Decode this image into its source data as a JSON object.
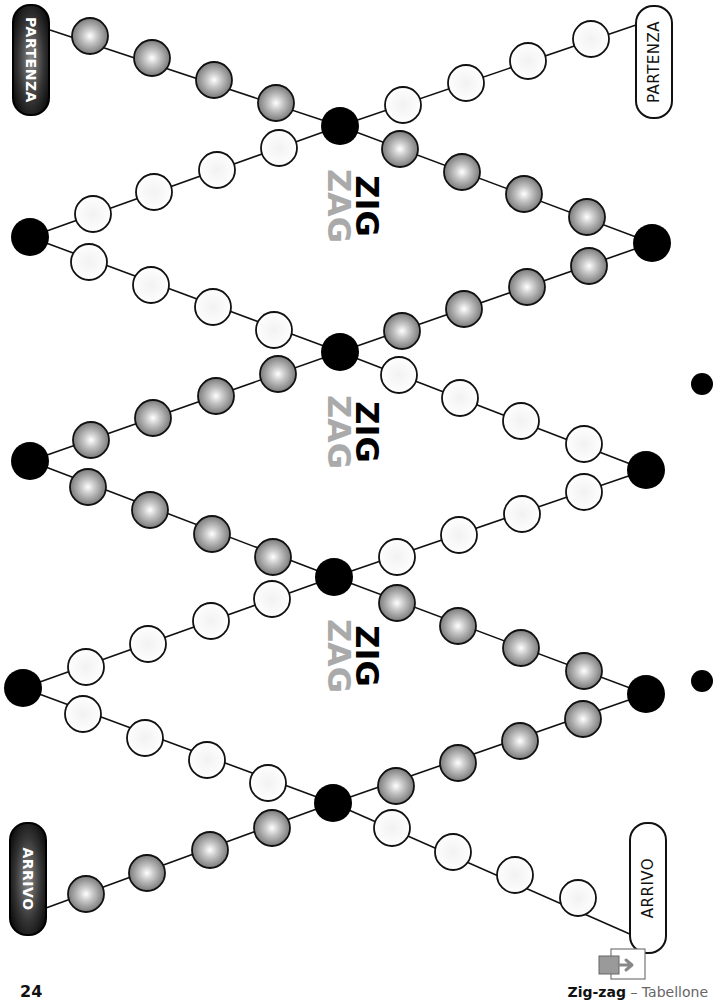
{
  "board": {
    "colors": {
      "gray_bead": "#9a9a9a",
      "white_bead": "#ffffff",
      "junction": "#000000",
      "line": "#111111",
      "zig": "#000000",
      "zag": "#aaaaaa"
    },
    "labels": {
      "start_left": "PARTENZA",
      "start_right": "PARTENZA",
      "finish_left": "ARRIVO",
      "finish_right": "ARRIVO"
    },
    "title_blocks": [
      {
        "zig": "ZIG",
        "zag": "ZAG"
      },
      {
        "zig": "ZIG",
        "zag": "ZAG"
      },
      {
        "zig": "ZIG",
        "zag": "ZAG"
      }
    ],
    "junctions": [
      {
        "id": "J1",
        "x": 340,
        "y": 126
      },
      {
        "id": "L1",
        "x": 30,
        "y": 237
      },
      {
        "id": "R1",
        "x": 652,
        "y": 243
      },
      {
        "id": "J2",
        "x": 340,
        "y": 352
      },
      {
        "id": "L2",
        "x": 30,
        "y": 461
      },
      {
        "id": "R2",
        "x": 646,
        "y": 470
      },
      {
        "id": "J3",
        "x": 334,
        "y": 577
      },
      {
        "id": "L3",
        "x": 23,
        "y": 688
      },
      {
        "id": "R3",
        "x": 646,
        "y": 694
      },
      {
        "id": "J4",
        "x": 333,
        "y": 803
      }
    ],
    "side_dots": [
      {
        "x": 702,
        "y": 384
      },
      {
        "x": 702,
        "y": 681
      }
    ],
    "segments": [
      {
        "from": [
          50,
          30
        ],
        "to": [
          340,
          126
        ],
        "type": "gray",
        "beads": [
          [
            90,
            36
          ],
          [
            152,
            58
          ],
          [
            214,
            80
          ],
          [
            276,
            103
          ]
        ]
      },
      {
        "from": [
          636,
          25
        ],
        "to": [
          340,
          126
        ],
        "type": "white",
        "beads": [
          [
            591,
            39
          ],
          [
            528,
            61
          ],
          [
            466,
            83
          ],
          [
            403,
            105
          ]
        ]
      },
      {
        "from": [
          340,
          126
        ],
        "to": [
          30,
          237
        ],
        "type": "white",
        "beads": [
          [
            279,
            148
          ],
          [
            217,
            170
          ],
          [
            154,
            192
          ],
          [
            93,
            214
          ]
        ]
      },
      {
        "from": [
          340,
          126
        ],
        "to": [
          652,
          243
        ],
        "type": "gray",
        "beads": [
          [
            400,
            149
          ],
          [
            462,
            172
          ],
          [
            524,
            194
          ],
          [
            587,
            217
          ]
        ]
      },
      {
        "from": [
          30,
          237
        ],
        "to": [
          340,
          352
        ],
        "type": "white",
        "beads": [
          [
            89,
            262
          ],
          [
            151,
            285
          ],
          [
            213,
            307
          ],
          [
            274,
            330
          ]
        ]
      },
      {
        "from": [
          652,
          243
        ],
        "to": [
          340,
          352
        ],
        "type": "gray",
        "beads": [
          [
            589,
            266
          ],
          [
            527,
            287
          ],
          [
            464,
            309
          ],
          [
            402,
            331
          ]
        ]
      },
      {
        "from": [
          340,
          352
        ],
        "to": [
          30,
          461
        ],
        "type": "gray",
        "beads": [
          [
            278,
            374
          ],
          [
            216,
            396
          ],
          [
            153,
            418
          ],
          [
            91,
            440
          ]
        ]
      },
      {
        "from": [
          340,
          352
        ],
        "to": [
          646,
          470
        ],
        "type": "white",
        "beads": [
          [
            399,
            375
          ],
          [
            460,
            398
          ],
          [
            521,
            421
          ],
          [
            584,
            444
          ]
        ]
      },
      {
        "from": [
          30,
          461
        ],
        "to": [
          334,
          577
        ],
        "type": "gray",
        "beads": [
          [
            88,
            487
          ],
          [
            150,
            510
          ],
          [
            212,
            534
          ],
          [
            273,
            557
          ]
        ]
      },
      {
        "from": [
          646,
          470
        ],
        "to": [
          334,
          577
        ],
        "type": "white",
        "beads": [
          [
            584,
            492
          ],
          [
            522,
            514
          ],
          [
            459,
            535
          ],
          [
            397,
            557
          ]
        ]
      },
      {
        "from": [
          334,
          577
        ],
        "to": [
          23,
          688
        ],
        "type": "white",
        "beads": [
          [
            272,
            599
          ],
          [
            211,
            621
          ],
          [
            148,
            644
          ],
          [
            86,
            667
          ]
        ]
      },
      {
        "from": [
          334,
          577
        ],
        "to": [
          646,
          694
        ],
        "type": "gray",
        "beads": [
          [
            397,
            603
          ],
          [
            458,
            626
          ],
          [
            521,
            648
          ],
          [
            584,
            671
          ]
        ]
      },
      {
        "from": [
          23,
          688
        ],
        "to": [
          333,
          803
        ],
        "type": "white",
        "beads": [
          [
            83,
            714
          ],
          [
            145,
            738
          ],
          [
            207,
            760
          ],
          [
            268,
            783
          ]
        ]
      },
      {
        "from": [
          646,
          694
        ],
        "to": [
          333,
          803
        ],
        "type": "gray",
        "beads": [
          [
            583,
            719
          ],
          [
            520,
            741
          ],
          [
            458,
            763
          ],
          [
            396,
            786
          ]
        ]
      },
      {
        "from": [
          333,
          803
        ],
        "to": [
          46,
          908
        ],
        "type": "gray",
        "beads": [
          [
            272,
            828
          ],
          [
            210,
            850
          ],
          [
            147,
            873
          ],
          [
            86,
            894
          ]
        ]
      },
      {
        "from": [
          333,
          803
        ],
        "to": [
          632,
          935
        ],
        "type": "white",
        "beads": [
          [
            392,
            828
          ],
          [
            453,
            852
          ],
          [
            515,
            875
          ],
          [
            578,
            898
          ]
        ]
      }
    ]
  },
  "footer": {
    "page_number": "24",
    "title": "Zig-zag",
    "separator": " – ",
    "subtitle": "Tabellone",
    "icon": "export-arrow-icon"
  }
}
